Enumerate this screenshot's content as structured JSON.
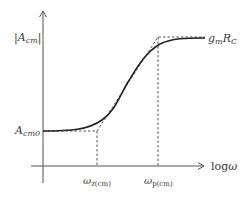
{
  "diagram": {
    "type": "bode-magnitude-asymptotic-plot",
    "y_axis": {
      "label_open": "|",
      "label_main": "A",
      "label_sub": "cm",
      "label_close": "|"
    },
    "x_axis": {
      "label_prefix": "log",
      "label_symbol": "ω"
    },
    "levels": {
      "low": {
        "main": "A",
        "sub": "cm0"
      },
      "high": {
        "g": "g",
        "g_sub": "m",
        "r": "R",
        "r_sub": "C"
      }
    },
    "frequencies": {
      "zero": {
        "symbol": "ω",
        "sub": "z(cm)"
      },
      "pole": {
        "symbol": "ω",
        "sub": "p(cm)"
      }
    },
    "colors": {
      "axis": "#555555",
      "curve": "#222222",
      "dashed": "#555555",
      "text": "#3a3a3a",
      "background": "#ffffff"
    }
  }
}
